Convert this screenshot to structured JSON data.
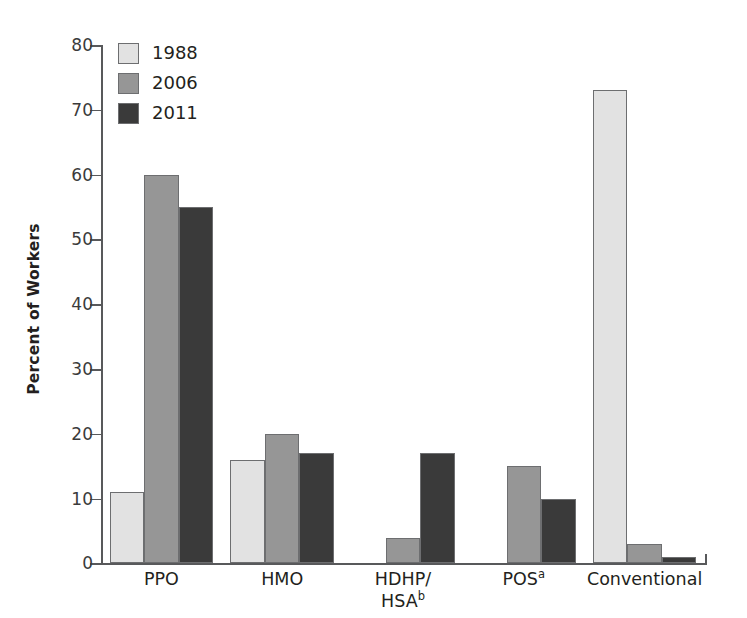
{
  "chart_data": {
    "type": "bar",
    "title": "",
    "xlabel": "",
    "ylabel": "Percent of Workers",
    "ylim": [
      0,
      80
    ],
    "yticks": [
      0,
      10,
      20,
      30,
      40,
      50,
      60,
      70,
      80
    ],
    "ytick_labels": [
      "0",
      "10",
      "20",
      "30",
      "40",
      "50",
      "60",
      "70",
      "80"
    ],
    "grid": false,
    "legend_position": "upper left",
    "categories": [
      "PPO",
      "HMO",
      "HDHP/\nHSAᵇ",
      "POSᵃ",
      "Conventional"
    ],
    "category_labels": [
      {
        "line1": "PPO",
        "line2": "",
        "sup1": "",
        "sup2": ""
      },
      {
        "line1": "HMO",
        "line2": "",
        "sup1": "",
        "sup2": ""
      },
      {
        "line1": "HDHP/",
        "line2": "HSA",
        "sup1": "",
        "sup2": "b"
      },
      {
        "line1": "POS",
        "line2": "",
        "sup1": "a",
        "sup2": ""
      },
      {
        "line1": "Conventional",
        "line2": "",
        "sup1": "",
        "sup2": ""
      }
    ],
    "series": [
      {
        "name": "1988",
        "color": "#e2e2e2",
        "values": [
          11,
          16,
          null,
          null,
          73
        ]
      },
      {
        "name": "2006",
        "color": "#969696",
        "values": [
          60,
          20,
          4,
          15,
          3
        ]
      },
      {
        "name": "2011",
        "color": "#3a3a3a",
        "values": [
          55,
          17,
          17,
          10,
          1
        ]
      }
    ]
  },
  "legend": {
    "entries": [
      {
        "label": "1988",
        "color": "#e2e2e2"
      },
      {
        "label": "2006",
        "color": "#969696"
      },
      {
        "label": "2011",
        "color": "#3a3a3a"
      }
    ]
  },
  "axes": {
    "y_title": "Percent of Workers",
    "y_tick_labels": [
      "80",
      "70",
      "60",
      "50",
      "40",
      "30",
      "20",
      "10",
      "0"
    ],
    "axis_color": "#58595b"
  }
}
